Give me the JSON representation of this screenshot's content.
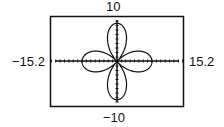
{
  "chart_data": {
    "type": "line",
    "title": "",
    "equation_form": "r = a·cos(2θ) (four-petal rose)",
    "window": {
      "xmin": -15.2,
      "xmax": 15.2,
      "ymin": -10,
      "ymax": 10
    },
    "labels": {
      "top": "10",
      "bottom": "-10",
      "left": "-15.2",
      "right": "15.2"
    },
    "petal_tips": [
      {
        "x": 8,
        "y": 0
      },
      {
        "x": -8,
        "y": 0
      },
      {
        "x": 0,
        "y": 8.5
      },
      {
        "x": 0,
        "y": -8.5
      }
    ],
    "axes": {
      "x_axis": true,
      "y_axis": true,
      "tick_marks": true
    },
    "grid": false,
    "legend": null
  },
  "labels": {
    "top": "10",
    "bottom": "−10",
    "left": "−15.2",
    "right": "15.2"
  },
  "colors": {
    "curve": "#111111",
    "frame": "#111111",
    "background": "#ffffff"
  }
}
